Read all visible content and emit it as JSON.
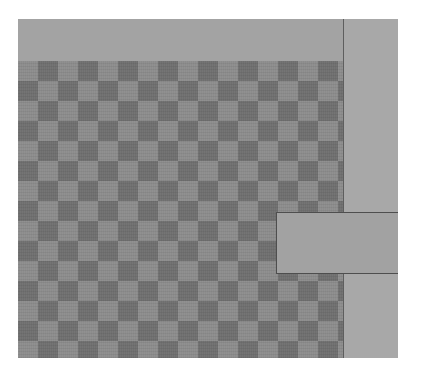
{
  "canvas": {
    "width": 423,
    "height": 382,
    "background": "#ffffff"
  },
  "panel": {
    "color": "#a6a6a6",
    "header_band": {
      "color": "#a3a3a3"
    },
    "checker_area": {
      "pattern": "checkerboard",
      "cell_size_px": 20,
      "dark_color": "#6f6f6f",
      "light_color": "#8c8c8c"
    },
    "right_column": {
      "color": "#a8a8a8"
    },
    "divider": {
      "color": "#5e5e5e"
    },
    "overlay_box": {
      "color": "#a2a2a2",
      "border_color": "#4e4e4e"
    }
  }
}
